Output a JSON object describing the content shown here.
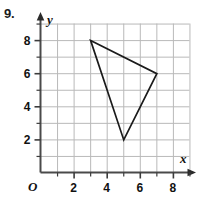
{
  "problem": {
    "number": "9."
  },
  "axes": {
    "x_label": "x",
    "y_label": "y",
    "origin_label": "O",
    "x_ticks": [
      "2",
      "4",
      "6",
      "8"
    ],
    "y_ticks": [
      "2",
      "4",
      "6",
      "8"
    ],
    "x_tick_values": [
      2,
      4,
      6,
      8
    ],
    "y_tick_values": [
      2,
      4,
      6,
      8
    ],
    "x_min": 0,
    "x_max": 9,
    "y_min": 0,
    "y_max": 9
  },
  "colors": {
    "grid": "#b9b9b9",
    "axis": "#4a4a4a",
    "shape_stroke": "#1a1a1a",
    "text": "#111111",
    "background": "#ffffff"
  },
  "chart_data": {
    "type": "scatter",
    "title": "",
    "xlabel": "x",
    "ylabel": "y",
    "xlim": [
      0,
      9
    ],
    "ylim": [
      0,
      9
    ],
    "grid": true,
    "legend": "none",
    "shapes": [
      {
        "name": "triangle",
        "closed": true,
        "fill": "none",
        "vertices": [
          {
            "x": 3,
            "y": 8
          },
          {
            "x": 7,
            "y": 6
          },
          {
            "x": 5,
            "y": 2
          }
        ]
      }
    ]
  }
}
